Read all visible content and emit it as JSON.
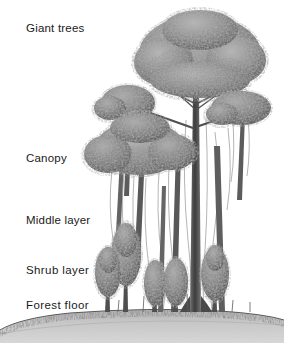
{
  "figure": {
    "background_color": "#ffffff",
    "width": 284,
    "height": 343,
    "medium": "pencil illustration"
  },
  "labels": [
    {
      "id": "giant-trees",
      "text": "Giant trees",
      "top": 22
    },
    {
      "id": "canopy",
      "text": "Canopy",
      "top": 152
    },
    {
      "id": "middle-layer",
      "text": "Middle layer",
      "top": 214
    },
    {
      "id": "shrub-layer",
      "text": "Shrub layer",
      "top": 264
    },
    {
      "id": "forest-floor",
      "text": "Forest floor",
      "top": 299
    }
  ],
  "colors": {
    "ink": "#1a1a1a",
    "foliage_dark": "#5a5a5a",
    "foliage_mid": "#8a8a8a",
    "foliage_light": "#b4b4b4",
    "trunk": "#4a4a4a",
    "ground": "#c2c2c2",
    "ground_shadow": "#a8a8a8",
    "grass_line": "#3d3d3d",
    "background": "#ffffff"
  },
  "scene": {
    "ground_line_y": 312,
    "emergent_tree": {
      "crown_cx": 200,
      "crown_cy": 52,
      "crown_rx": 62,
      "crown_ry": 40,
      "trunk_x": 196,
      "trunk_top": 88,
      "trunk_bottom": 312
    },
    "canopy_trees": [
      {
        "cx": 128,
        "cy": 105,
        "rx": 26,
        "ry": 17
      },
      {
        "cx": 240,
        "cy": 110,
        "rx": 30,
        "ry": 18
      },
      {
        "cx": 140,
        "cy": 148,
        "rx": 44,
        "ry": 27
      }
    ],
    "middle_trees": [
      {
        "cx": 126,
        "cy": 255,
        "rx": 15,
        "ry": 30
      },
      {
        "cx": 108,
        "cy": 272,
        "rx": 12,
        "ry": 24
      }
    ],
    "shrub_trees": [
      {
        "cx": 155,
        "cy": 283,
        "rx": 11,
        "ry": 22
      },
      {
        "cx": 176,
        "cy": 282,
        "rx": 12,
        "ry": 23
      },
      {
        "cx": 215,
        "cy": 275,
        "rx": 14,
        "ry": 27
      }
    ],
    "vine_count": 14
  }
}
